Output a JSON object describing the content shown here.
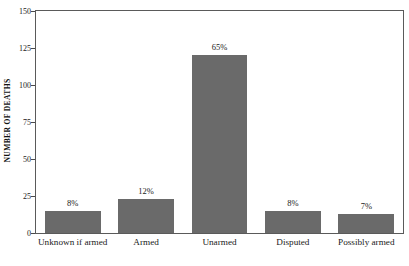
{
  "chart_data": {
    "type": "bar",
    "title": "",
    "xlabel": "",
    "ylabel": "NUMBER OF DEATHS",
    "categories": [
      "Unknown if armed",
      "Armed",
      "Unarmed",
      "Disputed",
      "Possibly armed"
    ],
    "values": [
      15,
      23,
      120,
      15,
      13
    ],
    "point_labels": [
      "8%",
      "12%",
      "65%",
      "8%",
      "7%"
    ],
    "ylim": [
      0,
      150
    ],
    "yticks": [
      0,
      25,
      50,
      75,
      100,
      125,
      150
    ],
    "ytick_labels": [
      "0",
      "25",
      "50",
      "75",
      "100",
      "125",
      "150"
    ],
    "grid": false,
    "legend": false,
    "bar_color": "#6a6a6a",
    "axis_color": "#5a5a5a",
    "background": "#ffffff"
  },
  "axis": {
    "y_title": "NUMBER OF DEATHS"
  }
}
